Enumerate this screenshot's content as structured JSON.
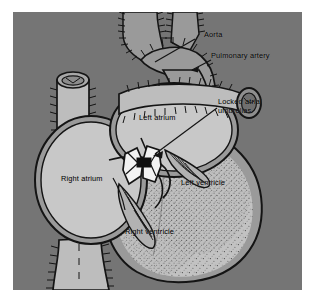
{
  "figure": {
    "kind": "medical-illustration",
    "view": "anterior coronal section"
  },
  "canvas": {
    "width": 316,
    "height": 304,
    "margin_color": "#ffffff",
    "panel": {
      "x": 13,
      "y": 12,
      "width": 289,
      "height": 278,
      "background_color": "#757575"
    }
  },
  "palette": {
    "background_gray": "#757575",
    "muscle_gray": "#9a9a9a",
    "chamber_light": "#c8c8c8",
    "vessel_light": "#bdbdbd",
    "ventricle_fill": "#c2c2c2",
    "ink_black": "#141414",
    "device_white": "#f2f2f2",
    "device_core_black": "#101010",
    "label_text": "#000000"
  },
  "labels": [
    {
      "id": "aorta",
      "text": "Aorta",
      "x": 196,
      "y": 32,
      "leader": {
        "type": "line",
        "from": [
          193,
          38
        ],
        "to": [
          152,
          58
        ]
      }
    },
    {
      "id": "pulmonary-artery",
      "text": "Pulmonary artery",
      "x": 212,
      "y": 52,
      "leader": {
        "type": "arrow",
        "from": [
          209,
          58
        ],
        "to": [
          187,
          66
        ]
      }
    },
    {
      "id": "locked-atrial-umbrellas",
      "text": "Locked atrial\numbrellas",
      "line1": "Locked atrial",
      "line2": "umbrellas",
      "x": 216,
      "y": 100,
      "leader": {
        "type": "arrow",
        "from": [
          214,
          105
        ],
        "to": [
          136,
          147
        ]
      }
    },
    {
      "id": "left-atrium",
      "text": "Left atrium",
      "x": 132,
      "y": 114,
      "leader": {
        "type": "none"
      }
    },
    {
      "id": "right-atrium",
      "text": "Right atrium",
      "x": 56,
      "y": 174,
      "leader": {
        "type": "none"
      }
    },
    {
      "id": "left-ventricle",
      "text": "Left ventricle",
      "x": 178,
      "y": 178,
      "leader": {
        "type": "none"
      }
    },
    {
      "id": "right-ventricle",
      "text": "Right ventricle",
      "x": 124,
      "y": 227,
      "leader": {
        "type": "none"
      }
    }
  ],
  "anatomy": {
    "structures": [
      {
        "id": "aortic-arch",
        "name": "Aortic arch with brachiocephalic branches",
        "style": "hatched-edge tube"
      },
      {
        "id": "pulmonary-artery-stump",
        "name": "Pulmonary artery cut stump",
        "style": "elliptical cross-section"
      },
      {
        "id": "superior-vena-cava",
        "name": "Superior vena cava",
        "style": "hatched-edge tube, cut open at top"
      },
      {
        "id": "inferior-vena-cava",
        "name": "Inferior vena cava",
        "style": "hatched-edge tube at bottom"
      },
      {
        "id": "left-atrium-chamber",
        "name": "Left atrium cavity",
        "style": "open light chamber"
      },
      {
        "id": "right-atrium-chamber",
        "name": "Right atrium cavity",
        "style": "open light chamber"
      },
      {
        "id": "left-ventricle-chamber",
        "name": "Left ventricle cavity",
        "style": "stippled chamber"
      },
      {
        "id": "right-ventricle-chamber",
        "name": "Right ventricle cavity",
        "style": "stippled chamber"
      },
      {
        "id": "tricuspid-valve",
        "name": "Tricuspid valve leaflets and chordae",
        "style": "line-shaded leaflets"
      },
      {
        "id": "mitral-valve",
        "name": "Mitral valve leaflets and chordae",
        "style": "line-shaded leaflets"
      },
      {
        "id": "atrial-septum",
        "name": "Interatrial septum defect site",
        "style": "device implantation site"
      },
      {
        "id": "umbrella-device",
        "name": "Double umbrella occluder, locked",
        "style": "white hourglass with black central core"
      }
    ]
  }
}
